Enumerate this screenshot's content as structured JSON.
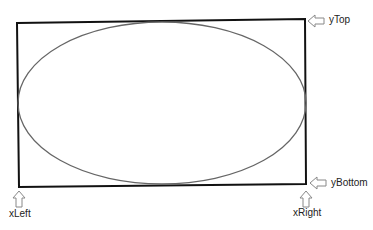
{
  "diagram": {
    "labels": {
      "yTop": "yTop",
      "yBottom": "yBottom",
      "xLeft": "xLeft",
      "xRight": "xRight"
    },
    "colors": {
      "rect_stroke": "#111111",
      "ellipse_stroke": "#666666",
      "arrow_stroke": "#888888"
    }
  }
}
